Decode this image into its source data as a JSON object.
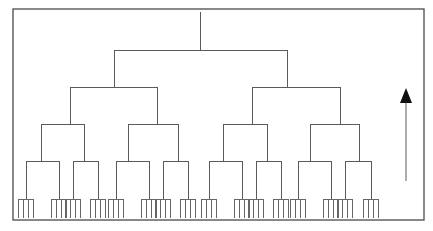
{
  "diagram": {
    "title": "",
    "type": "hierarchy-tree",
    "branching": 2,
    "internal_levels": 5,
    "leaves_per_terminal_node": 4,
    "terminal_node_count": 16,
    "line_color": "#5a5a5a",
    "frame_color": "#4a4a4a",
    "arrow": {
      "direction": "up",
      "meaning": "",
      "color": "#111111"
    },
    "labels": []
  }
}
